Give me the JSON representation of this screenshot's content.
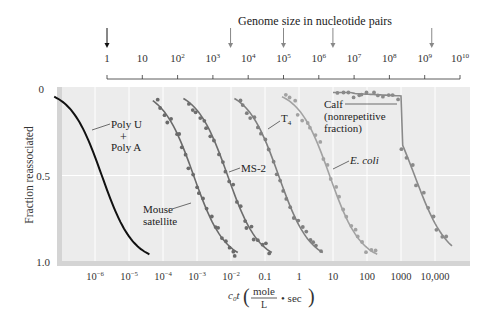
{
  "chart_data": {
    "type": "line",
    "title": "",
    "top_axis": {
      "title": "Genome size in nucleotide pairs",
      "ticks": [
        "1",
        "10",
        "10^2",
        "10^3",
        "10^4",
        "10^5",
        "10^6",
        "10^7",
        "10^8",
        "10^9",
        "10^10"
      ],
      "arrows_at_log10": [
        0,
        3.5,
        5,
        6.4,
        9.2
      ]
    },
    "xlabel": "c0t (mole/L · sec)",
    "x_ticks": [
      "10^-6",
      "10^-5",
      "10^-4",
      "10^-3",
      "10^-2",
      "0.1",
      "1",
      "10",
      "100",
      "1000",
      "10,000"
    ],
    "x_log10_range": [
      -7.3,
      4.8
    ],
    "ylabel": "Fraction reassociated",
    "y_ticks": [
      "0",
      "0.5",
      "1.0"
    ],
    "ylim": [
      0,
      1.0
    ],
    "y_inverted": true,
    "grid": true,
    "series": [
      {
        "name": "Poly U + Poly A",
        "color": "#111111",
        "midpoint_log10_c0t": -5.8,
        "points": false
      },
      {
        "name": "Mouse satellite",
        "color": "#6a6a6a",
        "midpoint_log10_c0t": -3.1,
        "points": true
      },
      {
        "name": "MS-2",
        "color": "#6e6e6e",
        "midpoint_log10_c0t": -2.1,
        "points": true
      },
      {
        "name": "T4",
        "color": "#7f7f7f",
        "midpoint_log10_c0t": -0.6,
        "points": true
      },
      {
        "name": "E. coli",
        "color": "#a2a2a2",
        "midpoint_log10_c0t": 0.9,
        "points": true
      },
      {
        "name": "Calf (nonrepetitive fraction)",
        "color": "#8a8a8a",
        "midpoint_log10_c0t": 3.4,
        "points": true
      }
    ],
    "annotations": [
      "Poly U",
      "+",
      "Poly A",
      "Mouse",
      "satellite",
      "MS-2",
      "T4",
      "E. coli",
      "Calf",
      "(nonrepetitive",
      "fraction)"
    ]
  },
  "labels": {
    "top_title": "Genome size in nucleotide pairs",
    "y_title": "Fraction reassociated",
    "x_title_c0t": "c",
    "x_title_sub": "0",
    "x_title_t": "t",
    "x_title_num": "mole",
    "x_title_den": "L",
    "x_title_tail": "• sec",
    "poly_u": "Poly U",
    "plus": "+",
    "poly_a": "Poly A",
    "mouse": "Mouse",
    "satellite": "satellite",
    "ms2": "MS-2",
    "t4": "T",
    "t4_sub": "4",
    "ecoli": "E. coli",
    "calf": "Calf",
    "nonrep": "(nonrepetitive",
    "fraction": "fraction)"
  }
}
